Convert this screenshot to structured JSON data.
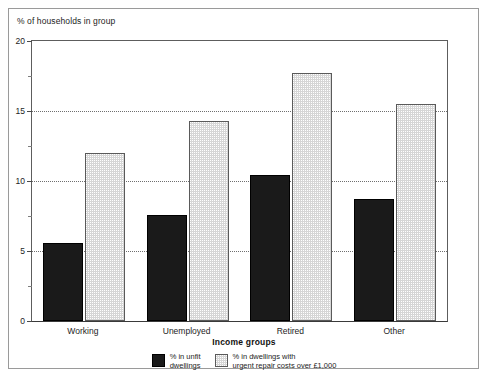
{
  "chart_data": {
    "type": "bar",
    "title": "",
    "ylabel": "% of households in group",
    "xlabel": "Income groups",
    "categories": [
      "Working",
      "Unemployed",
      "Retired",
      "Other"
    ],
    "series": [
      {
        "name": "% in unfit\ndwellings",
        "key": "unfit",
        "color": "#1a1a1a",
        "values": [
          5.6,
          7.6,
          10.4,
          8.7
        ]
      },
      {
        "name": "% in dwellings with\nurgent repair costs over £1,000",
        "key": "repair",
        "color": "#d6d6d6",
        "values": [
          12.0,
          14.3,
          17.7,
          15.5
        ]
      }
    ],
    "ylim": [
      0,
      20
    ],
    "yticks": [
      0,
      5,
      10,
      15,
      20
    ],
    "ytick_labels": [
      "0",
      "5",
      "10",
      "15",
      "20"
    ],
    "yticks_minor": [
      2.5,
      7.5,
      12.5,
      17.5
    ],
    "gridlines": [
      5,
      10,
      15
    ],
    "grid": true,
    "legend_position": "bottom"
  }
}
